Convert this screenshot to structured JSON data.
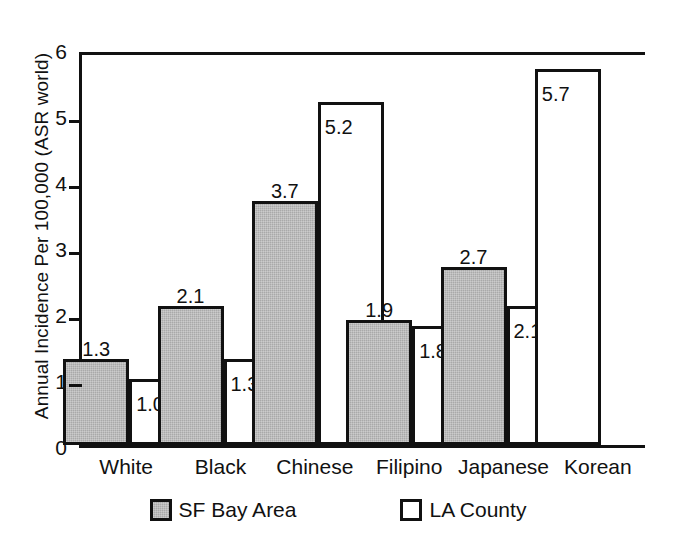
{
  "chart_data": {
    "type": "bar",
    "title": "",
    "xlabel": "",
    "ylabel": "Annual Incidence Per 100,000 (ASR world)",
    "ylim": [
      0,
      6
    ],
    "yticks": [
      "0",
      "1",
      "2",
      "3",
      "4",
      "5",
      "6"
    ],
    "grid": false,
    "legend_position": "bottom-center",
    "categories": [
      "White",
      "Black",
      "Chinese",
      "Filipino",
      "Japanese",
      "Korean"
    ],
    "series": [
      {
        "name": "SF Bay Area",
        "fill": "#a9a9a9",
        "values": [
          1.3,
          2.1,
          3.7,
          1.9,
          2.7,
          null
        ],
        "labels": [
          "1.3",
          "2.1",
          "3.7",
          "1.9",
          "2.7",
          ""
        ],
        "label_placement": "above"
      },
      {
        "name": "LA County",
        "fill": "#ffffff",
        "values": [
          1.0,
          1.3,
          5.2,
          1.8,
          2.1,
          5.7
        ],
        "labels": [
          "1.0",
          "1.3",
          "5.2",
          "1.8",
          "2.1",
          "5.7"
        ],
        "label_placement": "inside-top"
      }
    ]
  },
  "axis": {
    "y_title": "Annual Incidence Per 100,000 (ASR world)",
    "y_tick_labels": [
      "6",
      "5",
      "4",
      "3",
      "2",
      "1",
      "0"
    ]
  },
  "x_categories": [
    {
      "label": "White"
    },
    {
      "label": "Black"
    },
    {
      "label": "Chinese"
    },
    {
      "label": "Filipino"
    },
    {
      "label": "Japanese"
    },
    {
      "label": "Korean"
    }
  ],
  "bars": [
    {
      "group": "White",
      "series": "SF Bay Area",
      "value": "1.3",
      "style": "sf",
      "label_pos": "above"
    },
    {
      "group": "White",
      "series": "LA County",
      "value": "1.0",
      "style": "la",
      "label_pos": "inside"
    },
    {
      "group": "Black",
      "series": "SF Bay Area",
      "value": "2.1",
      "style": "sf",
      "label_pos": "above"
    },
    {
      "group": "Black",
      "series": "LA County",
      "value": "1.3",
      "style": "la",
      "label_pos": "inside"
    },
    {
      "group": "Chinese",
      "series": "SF Bay Area",
      "value": "3.7",
      "style": "sf",
      "label_pos": "above"
    },
    {
      "group": "Chinese",
      "series": "LA County",
      "value": "5.2",
      "style": "la",
      "label_pos": "inside"
    },
    {
      "group": "Filipino",
      "series": "SF Bay Area",
      "value": "1.9",
      "style": "sf",
      "label_pos": "above"
    },
    {
      "group": "Filipino",
      "series": "LA County",
      "value": "1.8",
      "style": "la",
      "label_pos": "inside"
    },
    {
      "group": "Japanese",
      "series": "SF Bay Area",
      "value": "2.7",
      "style": "sf",
      "label_pos": "above"
    },
    {
      "group": "Japanese",
      "series": "LA County",
      "value": "2.1",
      "style": "la",
      "label_pos": "inside"
    },
    {
      "group": "Korean",
      "series": "LA County",
      "value": "5.7",
      "style": "la",
      "label_pos": "inside"
    }
  ],
  "legend": {
    "entries": [
      {
        "label": "SF Bay Area",
        "style": "sf"
      },
      {
        "label": "LA County",
        "style": "la"
      }
    ]
  }
}
